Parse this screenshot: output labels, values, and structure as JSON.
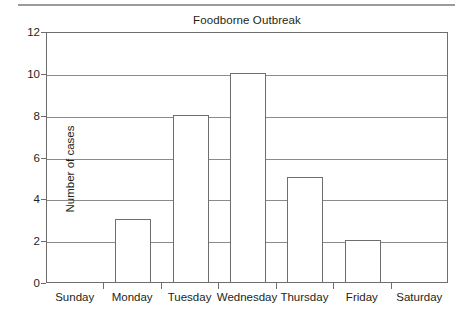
{
  "chart_data": {
    "type": "bar",
    "title": "Foodborne Outbreak",
    "xlabel": "",
    "ylabel": "Number of cases",
    "categories": [
      "Sunday",
      "Monday",
      "Tuesday",
      "Wednesday",
      "Thursday",
      "Friday",
      "Saturday"
    ],
    "values": [
      0,
      3,
      8,
      10,
      5,
      2,
      0
    ],
    "ylim": [
      0,
      12
    ],
    "ytick_values": [
      0,
      2,
      4,
      6,
      8,
      10,
      12
    ],
    "ytick_labels": [
      "0",
      "2",
      "4",
      "6",
      "8",
      "10",
      "12"
    ],
    "grid": true,
    "grid_axis": "y",
    "legend": false,
    "legend_position": "none",
    "bar_fill": "#ffffff",
    "bar_edge_color": "#6e6e6e",
    "axis_color": "#6e6e6e",
    "grid_color": "#8a8a8a",
    "text_color": "#231f20",
    "background": "#ffffff"
  },
  "decoration": {
    "top_rule_color": "#9b9b9b"
  }
}
